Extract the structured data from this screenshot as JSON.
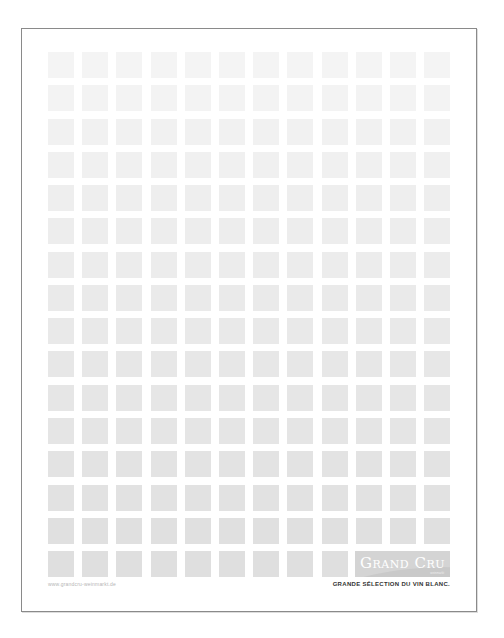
{
  "document": {
    "type": "letterhead",
    "grid": {
      "columns": 12,
      "rows": 16,
      "start_x": 48,
      "start_y": 52,
      "col_pitch": 34.2,
      "row_pitch": 33.27,
      "square_size": 26,
      "color_top": "#f4f4f4",
      "color_bottom": "#dfdfdf"
    },
    "brand": {
      "name": "Grand Cru",
      "sub": "weinmarkt",
      "box_color": "#d4d4d4"
    },
    "footer": {
      "url": "www.grandcru-weinmarkt.de",
      "tagline": "GRANDE SÉLECTION DU VIN BLANC."
    },
    "border_color": "#8a8a8a"
  }
}
